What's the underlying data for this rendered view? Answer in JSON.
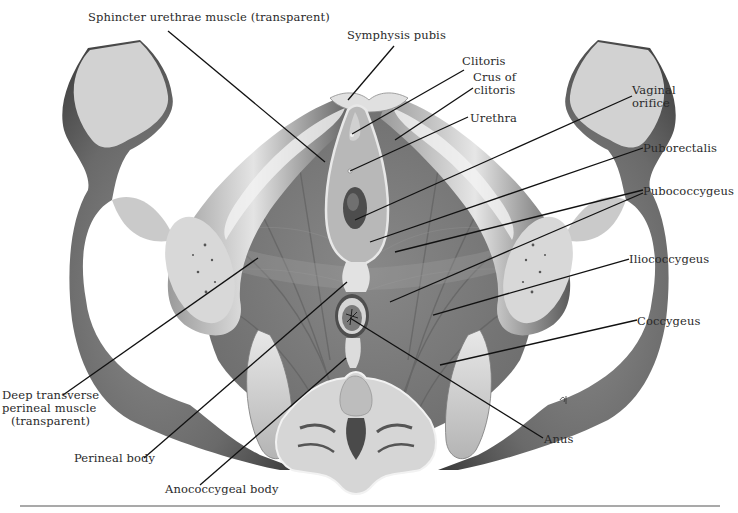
{
  "figure": {
    "colors": {
      "background": "#ffffff",
      "muscle": "#7d7d7d",
      "muscle_dark": "#5e5e5e",
      "bone_light": "#dcdcdc",
      "bone_mid": "#a9a9a9",
      "bone_dark": "#4a4a4a",
      "leader_line": "#111111",
      "label_text": "#2a2a2a",
      "rule": "#555555"
    },
    "labels": [
      {
        "id": "sphincter-urethrae",
        "text": "Sphincter urethrae muscle (transparent)",
        "x": 88,
        "y": 17,
        "align": "left",
        "line": [
          [
            168,
            31
          ],
          [
            325,
            162
          ]
        ]
      },
      {
        "id": "symphysis-pubis",
        "text": "Symphysis pubis",
        "x": 347,
        "y": 35,
        "align": "left",
        "line": [
          [
            394,
            46
          ],
          [
            348,
            100
          ]
        ]
      },
      {
        "id": "clitoris",
        "text": "Clitoris",
        "x": 462,
        "y": 61,
        "align": "left",
        "line": [
          [
            464,
            70
          ],
          [
            352,
            134
          ]
        ]
      },
      {
        "id": "crus-of-clitoris",
        "text": "Crus of\nclitoris",
        "x": 473,
        "y": 77,
        "align": "center",
        "line": [
          [
            473,
            88
          ],
          [
            395,
            140
          ]
        ]
      },
      {
        "id": "urethra",
        "text": "Urethra",
        "x": 470,
        "y": 112,
        "align": "left",
        "line": [
          [
            468,
            117
          ],
          [
            350,
            171
          ]
        ]
      },
      {
        "id": "vaginal-orifice",
        "text": "Vaginal\norifice",
        "x": 632,
        "y": 84,
        "align": "left",
        "line": [
          [
            632,
            96
          ],
          [
            355,
            220
          ]
        ]
      },
      {
        "id": "puborectalis",
        "text": "Puborectalis",
        "x": 643,
        "y": 142,
        "align": "left",
        "line": [
          [
            643,
            148
          ],
          [
            370,
            242
          ]
        ]
      },
      {
        "id": "pubococcygeus",
        "text": "Pubococcygeus",
        "x": 643,
        "y": 185,
        "align": "left",
        "lines": [
          [
            [
              643,
              190
            ],
            [
              395,
              252
            ]
          ],
          [
            [
              643,
              193
            ],
            [
              390,
              302
            ]
          ]
        ]
      },
      {
        "id": "iliococcygeus",
        "text": "Iliococcygeus",
        "x": 629,
        "y": 253,
        "align": "left",
        "line": [
          [
            629,
            259
          ],
          [
            433,
            315
          ]
        ]
      },
      {
        "id": "coccygeus",
        "text": "Coccygeus",
        "x": 637,
        "y": 315,
        "align": "left",
        "line": [
          [
            637,
            320
          ],
          [
            440,
            365
          ]
        ]
      },
      {
        "id": "anus",
        "text": "Anus",
        "x": 544,
        "y": 433,
        "align": "left",
        "line": [
          [
            543,
            438
          ],
          [
            350,
            328
          ]
        ]
      },
      {
        "id": "deep-transverse-perineal",
        "text": "Deep transverse\nperineal muscle\n(transparent)",
        "x": 2,
        "y": 389,
        "align": "right",
        "line": [
          [
            63,
            395
          ],
          [
            258,
            258
          ]
        ]
      },
      {
        "id": "perineal-body",
        "text": "Perineal body",
        "x": 74,
        "y": 452,
        "align": "left",
        "line": [
          [
            144,
            458
          ],
          [
            347,
            282
          ]
        ]
      },
      {
        "id": "anococcygeal-body",
        "text": "Anococcygeal body",
        "x": 165,
        "y": 483,
        "align": "left",
        "line": [
          [
            200,
            485
          ],
          [
            346,
            358
          ]
        ]
      }
    ],
    "rule": {
      "x1": 20,
      "x2": 720,
      "y": 506
    }
  }
}
